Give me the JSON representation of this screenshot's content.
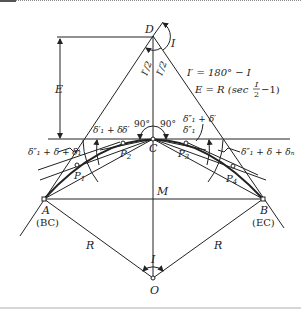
{
  "diagram": {
    "points": {
      "D": {
        "label": "D"
      },
      "C": {
        "label": "C"
      },
      "A": {
        "label": "A",
        "sublabel": "(BC)"
      },
      "B": {
        "label": "B",
        "sublabel": "(EC)"
      },
      "O": {
        "label": "O"
      },
      "M": {
        "label": "M"
      },
      "P1": {
        "label": "P",
        "sub": "1"
      },
      "P2": {
        "label": "P",
        "sub": "2"
      },
      "P3": {
        "label": "P",
        "sub": "3"
      },
      "P4": {
        "label": "P",
        "sub": "4"
      }
    },
    "angles": {
      "I_top": "I",
      "I_bottom": "I",
      "half_left": "I′/2",
      "half_right": "I′/2",
      "right_left": "90°",
      "right_right": "90°"
    },
    "lengths": {
      "E": "E",
      "R_left": "R",
      "R_right": "R"
    },
    "formulas": {
      "f1": "I′ = 180° − I",
      "f2_prefix": "E = R (sec",
      "f2_num": "I",
      "f2_den": "2",
      "f2_suffix": "−1)"
    },
    "deflection_labels": {
      "left_top_a": "δ′₁ + δ",
      "left_top_b": "δ′",
      "left_side": "δ″₁ + δ + δ₁",
      "right_top_a": "δ″₁ + δ′",
      "right_top_b": "δ″₁",
      "right_side": "δ″₁ + δ + δₙ"
    }
  }
}
